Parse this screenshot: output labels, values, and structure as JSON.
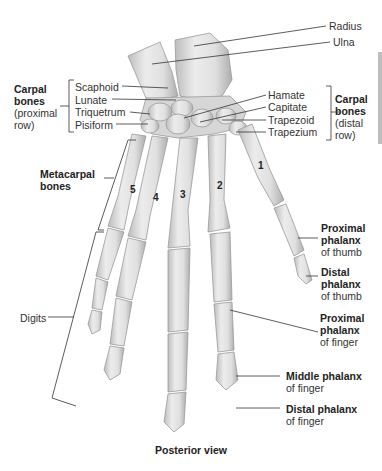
{
  "figure": {
    "view_caption": "Posterior view",
    "colors": {
      "bone": "#e4e4e4",
      "bone_shade": "#b9b9b9",
      "bone_outline": "#9a9a9a",
      "leader": "#333333",
      "side_bar": "#bdbdbd"
    }
  },
  "labels": {
    "radius": "Radius",
    "ulna": "Ulna",
    "carpal_proximal": {
      "title_line1": "Carpal",
      "title_line2": "bones",
      "sub_line1": "(proximal",
      "sub_line2": "row)"
    },
    "carpal_proximal_items": [
      "Scaphoid",
      "Lunate",
      "Triquetrum",
      "Pisiform"
    ],
    "carpal_distal_items": [
      "Hamate",
      "Capitate",
      "Trapezoid",
      "Trapezium"
    ],
    "carpal_distal": {
      "title_line1": "Carpal",
      "title_line2": "bones",
      "sub_line1": "(distal",
      "sub_line2": "row)"
    },
    "metacarpal": {
      "line1": "Metacarpal",
      "line2": "bones"
    },
    "metacarpal_numbers": [
      "1",
      "2",
      "3",
      "4",
      "5"
    ],
    "digits": "Digits",
    "proximal_phalanx_thumb": {
      "line1": "Proximal",
      "line2": "phalanx",
      "line3": "of thumb"
    },
    "distal_phalanx_thumb": {
      "line1": "Distal",
      "line2": "phalanx",
      "line3": "of thumb"
    },
    "proximal_phalanx_finger": {
      "line1": "Proximal",
      "line2": "phalanx",
      "line3": "of finger"
    },
    "middle_phalanx_finger": {
      "line1": "Middle phalanx",
      "line2": "of finger"
    },
    "distal_phalanx_finger": {
      "line1": "Distal phalanx",
      "line2": "of finger"
    }
  }
}
